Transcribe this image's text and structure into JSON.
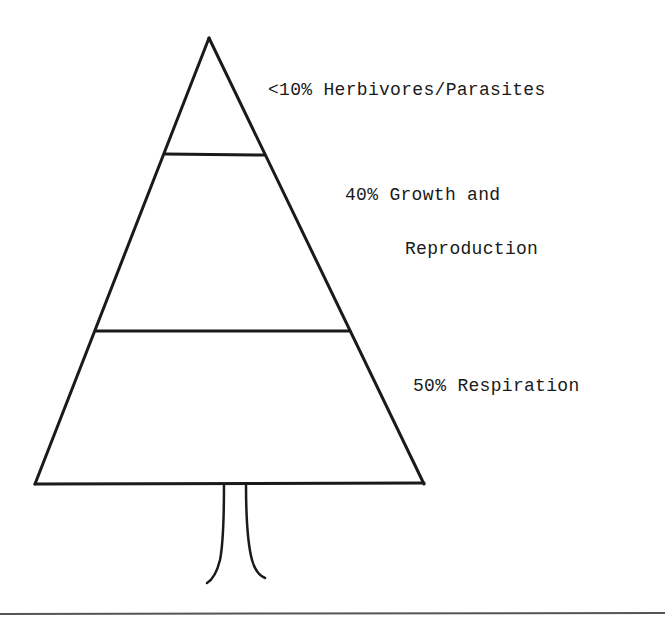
{
  "diagram": {
    "type": "tree-pyramid",
    "tiers": [
      {
        "rank": "top",
        "percent": "<10%",
        "text": "<10% Herbivores/Parasites"
      },
      {
        "rank": "middle",
        "percent": "40%",
        "text_line1": "40% Growth and",
        "text_line2": "Reproduction"
      },
      {
        "rank": "bottom",
        "percent": "50%",
        "text": "50% Respiration"
      }
    ],
    "has_trunk": true,
    "stroke_color": "#1a1a1a",
    "background_color": "#ffffff"
  }
}
